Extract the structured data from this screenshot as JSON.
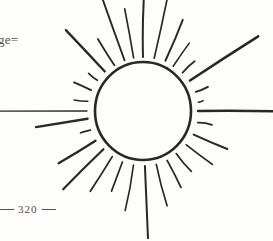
{
  "page": {
    "background_color": "#fdfdfc",
    "ink_color": "#2a2826",
    "width": 273,
    "height": 241
  },
  "margin": {
    "header_fragment": "ge=",
    "folio_number": "320"
  },
  "illustration": {
    "name": "radiant-sun-woodcut",
    "disc": {
      "center_x": 143,
      "center_y": 111,
      "radius_x": 48,
      "radius_y": 49,
      "stroke_width": 2.6,
      "stroke_color": "#2a2826",
      "fill": "none"
    },
    "rays": [
      {
        "angle": -90,
        "inner": 54,
        "outer": 116,
        "width": 2.0
      },
      {
        "angle": -78,
        "inner": 54,
        "outer": 118,
        "width": 1.7
      },
      {
        "angle": -66,
        "inner": 55,
        "outer": 100,
        "width": 1.9
      },
      {
        "angle": -56,
        "inner": 54,
        "outer": 82,
        "width": 1.6
      },
      {
        "angle": -44,
        "inner": 55,
        "outer": 72,
        "width": 1.8
      },
      {
        "angle": -33,
        "inner": 56,
        "outer": 138,
        "width": 2.6
      },
      {
        "angle": -20,
        "inner": 56,
        "outer": 68,
        "width": 1.9
      },
      {
        "angle": -9,
        "inner": 56,
        "outer": 60,
        "width": 1.5
      },
      {
        "angle": 0,
        "inner": 55,
        "outer": 132,
        "width": 2.4
      },
      {
        "angle": 12,
        "inner": 56,
        "outer": 70,
        "width": 1.7
      },
      {
        "angle": 25,
        "inner": 56,
        "outer": 92,
        "width": 2.1
      },
      {
        "angle": 38,
        "inner": 55,
        "outer": 88,
        "width": 1.8
      },
      {
        "angle": 52,
        "inner": 54,
        "outer": 78,
        "width": 1.7
      },
      {
        "angle": 64,
        "inner": 55,
        "outer": 86,
        "width": 1.8
      },
      {
        "angle": 76,
        "inner": 55,
        "outer": 98,
        "width": 1.7
      },
      {
        "angle": 88,
        "inner": 55,
        "outer": 128,
        "width": 2.0
      },
      {
        "angle": 100,
        "inner": 55,
        "outer": 100,
        "width": 1.6
      },
      {
        "angle": 112,
        "inner": 55,
        "outer": 86,
        "width": 1.7
      },
      {
        "angle": 124,
        "inner": 55,
        "outer": 96,
        "width": 1.8
      },
      {
        "angle": 136,
        "inner": 55,
        "outer": 112,
        "width": 2.2
      },
      {
        "angle": 148,
        "inner": 56,
        "outer": 100,
        "width": 2.3
      },
      {
        "angle": 160,
        "inner": 56,
        "outer": 66,
        "width": 1.8
      },
      {
        "angle": 172,
        "inner": 56,
        "outer": 108,
        "width": 2.4
      },
      {
        "angle": 180,
        "inner": 56,
        "outer": 148,
        "width": 1.3
      },
      {
        "angle": -170,
        "inner": 56,
        "outer": 70,
        "width": 1.6
      },
      {
        "angle": -158,
        "inner": 56,
        "outer": 74,
        "width": 1.9
      },
      {
        "angle": -146,
        "inner": 55,
        "outer": 66,
        "width": 1.7
      },
      {
        "angle": -134,
        "inner": 55,
        "outer": 112,
        "width": 2.3
      },
      {
        "angle": -122,
        "inner": 54,
        "outer": 84,
        "width": 1.8
      },
      {
        "angle": -110,
        "inner": 54,
        "outer": 120,
        "width": 1.9
      },
      {
        "angle": -100,
        "inner": 54,
        "outer": 104,
        "width": 1.7
      }
    ]
  }
}
